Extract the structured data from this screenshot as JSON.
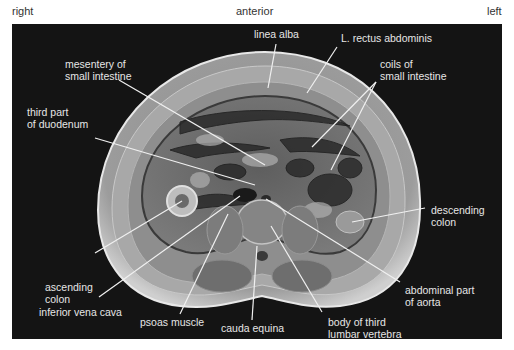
{
  "orientation": {
    "right": "right",
    "anterior": "anterior",
    "left": "left"
  },
  "colors": {
    "background": "#141414",
    "label_text": "#e6e6e6",
    "leader_line": "#f0f0f0",
    "orientation_text": "#333333"
  },
  "labels": [
    {
      "id": "linea-alba",
      "text": "linea alba"
    },
    {
      "id": "rectus-abdominis",
      "text": "L. rectus abdominis"
    },
    {
      "id": "mesentery",
      "text": "mesentery of\nsmall intestine"
    },
    {
      "id": "coils",
      "text": "coils of\nsmall intestine"
    },
    {
      "id": "duodenum",
      "text": "third part\nof duodenum"
    },
    {
      "id": "descending-colon",
      "text": "descending\ncolon"
    },
    {
      "id": "ascending-colon",
      "text": "ascending\ncolon"
    },
    {
      "id": "aorta",
      "text": "abdominal part\nof aorta"
    },
    {
      "id": "ivc",
      "text": "inferior vena cava"
    },
    {
      "id": "psoas",
      "text": "psoas muscle"
    },
    {
      "id": "cauda-equina",
      "text": "cauda equina"
    },
    {
      "id": "vertebra",
      "text": "body of third\nlumbar vertebra"
    }
  ]
}
